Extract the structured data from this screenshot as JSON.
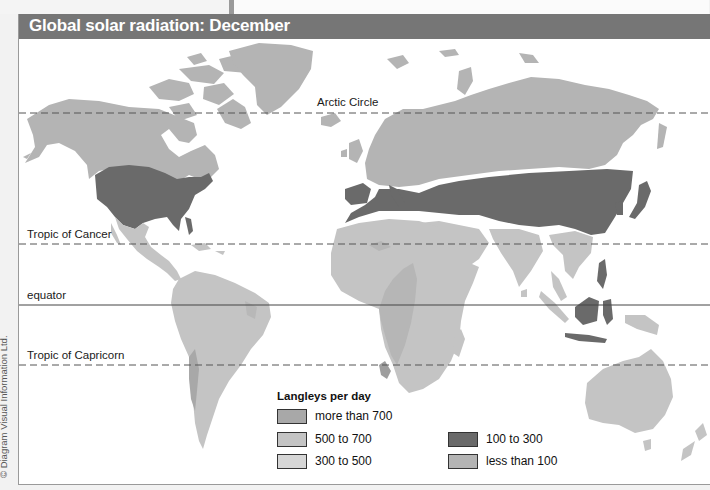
{
  "title": "Global solar radiation: December",
  "credit": "© Diagram Visual Information Ltd.",
  "colors": {
    "more_than_700": "#a8a8a8",
    "500_to_700": "#c4c4c4",
    "300_to_500": "#d6d6d6",
    "100_to_300": "#6a6a6a",
    "less_than_100": "#b4b4b4",
    "title_bar": "#767676"
  },
  "latitude_lines": [
    {
      "label": "Arctic Circle",
      "style": "dashed"
    },
    {
      "label": "Tropic of Cancer",
      "style": "dashed"
    },
    {
      "label": "equator",
      "style": "solid"
    },
    {
      "label": "Tropic of Capricorn",
      "style": "dashed"
    }
  ],
  "legend": {
    "title": "Langleys per day",
    "items": [
      {
        "label": "more than 700",
        "color": "#a8a8a8"
      },
      {
        "label": "500 to 700",
        "color": "#c4c4c4"
      },
      {
        "label": "300 to 500",
        "color": "#d6d6d6"
      },
      {
        "label": "100 to 300",
        "color": "#6a6a6a"
      },
      {
        "label": "less than 100",
        "color": "#b4b4b4"
      }
    ]
  }
}
